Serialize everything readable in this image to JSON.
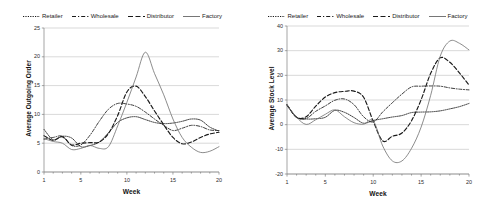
{
  "figure": {
    "background": "#ffffff",
    "line_color": "#1a1a1a",
    "grid_color": "#bfbfbf",
    "axis_color": "#808080"
  },
  "legend": {
    "items": [
      {
        "label": "Retailer",
        "style": "dotted",
        "icon": "line-dotted-icon"
      },
      {
        "label": "Wholesale",
        "style": "dashdot",
        "icon": "line-dashdot-icon"
      },
      {
        "label": "Distributor",
        "style": "dashed",
        "icon": "line-dashed-icon"
      },
      {
        "label": "Factory",
        "style": "solid",
        "icon": "line-solid-icon"
      }
    ]
  },
  "chart_data": [
    {
      "id": "outgoing-order",
      "type": "line",
      "title": "",
      "xlabel": "Week",
      "ylabel": "Average Outgoing Order",
      "xlim": [
        1,
        20
      ],
      "ylim": [
        0,
        25
      ],
      "xticks": [
        1,
        5,
        10,
        15,
        20
      ],
      "yticks": [
        0,
        5,
        10,
        15,
        20,
        25
      ],
      "grid": "horizontal",
      "legend_position": "top",
      "x": [
        1,
        2,
        3,
        4,
        5,
        6,
        7,
        8,
        9,
        10,
        11,
        12,
        13,
        14,
        15,
        16,
        17,
        18,
        19,
        20
      ],
      "series": [
        {
          "name": "Retailer",
          "style": "dotted",
          "values": [
            7.4,
            5.6,
            6.2,
            5.9,
            4.4,
            4.6,
            5.2,
            6.8,
            8.6,
            9.4,
            9.6,
            9.1,
            8.6,
            8.4,
            8.5,
            8.8,
            9.2,
            9.0,
            7.8,
            7.1
          ]
        },
        {
          "name": "Wholesale",
          "style": "dashdot",
          "values": [
            5.7,
            6.0,
            6.2,
            4.6,
            4.7,
            6.4,
            8.8,
            10.9,
            11.9,
            11.8,
            11.4,
            10.4,
            9.2,
            8.1,
            7.2,
            7.6,
            8.1,
            7.9,
            7.3,
            7.2
          ]
        },
        {
          "name": "Distributor",
          "style": "dashed",
          "values": [
            6.3,
            5.5,
            6.1,
            4.7,
            5.0,
            5.1,
            5.2,
            6.7,
            9.8,
            13.9,
            14.9,
            13.1,
            10.6,
            8.2,
            6.0,
            4.9,
            5.2,
            6.0,
            6.6,
            6.9
          ]
        },
        {
          "name": "Factory",
          "style": "solid",
          "values": [
            5.8,
            5.3,
            5.0,
            3.9,
            4.1,
            4.6,
            4.1,
            4.4,
            8.0,
            12.1,
            16.5,
            20.8,
            17.1,
            13.4,
            9.2,
            6.0,
            4.3,
            3.4,
            3.6,
            4.4
          ]
        }
      ]
    },
    {
      "id": "stock-level",
      "type": "line",
      "title": "",
      "xlabel": "Week",
      "ylabel": "Average Stock Level",
      "xlim": [
        1,
        20
      ],
      "ylim": [
        -20,
        40
      ],
      "xticks": [
        1,
        5,
        10,
        15,
        20
      ],
      "yticks": [
        -20,
        -10,
        0,
        10,
        20,
        30,
        40
      ],
      "grid": "horizontal",
      "legend_position": "top",
      "x": [
        1,
        2,
        3,
        4,
        5,
        6,
        7,
        8,
        9,
        10,
        11,
        12,
        13,
        14,
        15,
        16,
        17,
        18,
        19,
        20
      ],
      "series": [
        {
          "name": "Retailer",
          "style": "dotted",
          "values": [
            8.0,
            3.0,
            2.3,
            2.4,
            3.0,
            5.8,
            5.0,
            2.9,
            0.6,
            1.7,
            2.4,
            3.1,
            3.7,
            4.9,
            5.1,
            5.2,
            5.6,
            6.4,
            7.3,
            8.6
          ]
        },
        {
          "name": "Wholesale",
          "style": "dashdot",
          "values": [
            8.0,
            3.0,
            2.5,
            5.4,
            7.6,
            9.9,
            10.4,
            8.1,
            3.2,
            1.1,
            5.2,
            8.9,
            12.4,
            15.3,
            15.6,
            15.7,
            15.6,
            14.9,
            14.4,
            14.1
          ]
        },
        {
          "name": "Distributor",
          "style": "dashed",
          "values": [
            8.0,
            3.0,
            3.2,
            7.5,
            11.2,
            13.0,
            13.5,
            13.6,
            11.1,
            1.4,
            -6.6,
            -4.7,
            -3.4,
            1.6,
            10.1,
            20.8,
            27.1,
            25.3,
            21.0,
            16.1
          ]
        },
        {
          "name": "Factory",
          "style": "solid",
          "values": [
            8.0,
            3.0,
            0.1,
            2.0,
            4.2,
            6.0,
            3.2,
            0.8,
            0.2,
            1.6,
            -8.7,
            -14.7,
            -14.7,
            -9.6,
            -1.0,
            11.9,
            27.8,
            33.9,
            33.0,
            30.3
          ]
        }
      ]
    }
  ]
}
